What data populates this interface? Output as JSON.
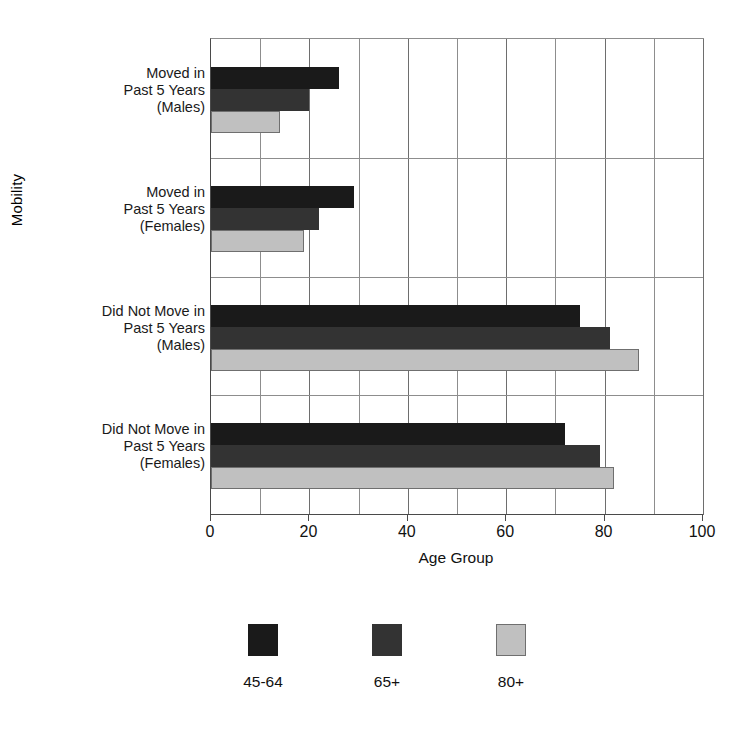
{
  "chart_data": {
    "type": "bar",
    "orientation": "horizontal",
    "title": "",
    "xlabel": "Age Group",
    "ylabel": "Mobility",
    "xlim": [
      0,
      100
    ],
    "xticks": [
      0,
      20,
      40,
      60,
      80,
      100
    ],
    "xtick_labels": [
      "0",
      "20",
      "40",
      "60",
      "80",
      "100"
    ],
    "minor_gridlines_every": 10,
    "grid": true,
    "legend_position": "bottom",
    "categories": [
      "Moved in\nPast 5 Years\n(Males)",
      "Moved in\nPast 5 Years\n(Females)",
      "Did Not Move in\nPast 5 Years\n(Males)",
      "Did Not Move in\nPast 5 Years\n(Females)"
    ],
    "category_lines": [
      [
        "Moved in",
        "Past 5 Years",
        "(Males)"
      ],
      [
        "Moved in",
        "Past 5 Years",
        "(Females)"
      ],
      [
        "Did Not Move in",
        "Past 5 Years",
        "(Males)"
      ],
      [
        "Did Not Move in",
        "Past 5 Years",
        "(Females)"
      ]
    ],
    "series": [
      {
        "name": "45-64",
        "color": "#1a1a1a",
        "values": [
          26,
          29,
          75,
          72
        ]
      },
      {
        "name": "65+",
        "color": "#333333",
        "values": [
          20,
          22,
          81,
          79
        ]
      },
      {
        "name": "80+",
        "color": "#c0c0c0",
        "values": [
          14,
          19,
          87,
          82
        ]
      }
    ]
  },
  "legend": {
    "items": [
      {
        "label": "45-64",
        "color": "#1a1a1a"
      },
      {
        "label": "65+",
        "color": "#333333"
      },
      {
        "label": "80+",
        "color": "#c0c0c0"
      }
    ]
  },
  "axes": {
    "x_title": "Age Group",
    "y_title": "Mobility"
  }
}
